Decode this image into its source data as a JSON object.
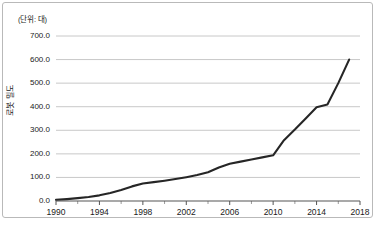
{
  "figure": {
    "unit_note": "(단위: 대)",
    "y_axis_title": "로봇 밀도",
    "frame_color": "#b9b9b9",
    "grid_color": "#c8c8c8",
    "axis_color": "#555555",
    "series_color": "#262626"
  },
  "chart_data": {
    "type": "line",
    "title": "",
    "subtitle": "",
    "xlabel": "",
    "ylabel": "로봇 밀도",
    "unit": "(단위: 대)",
    "xlim": [
      1990,
      2018
    ],
    "ylim": [
      0,
      700
    ],
    "grid": true,
    "legend": "none",
    "y_ticks": [
      "0.0",
      "100.0",
      "200.0",
      "300.0",
      "400.0",
      "500.0",
      "600.0",
      "700.0"
    ],
    "y_tick_values": [
      0,
      100,
      200,
      300,
      400,
      500,
      600,
      700
    ],
    "x_ticks": [
      "1990",
      "1994",
      "1998",
      "2002",
      "2006",
      "2010",
      "2014",
      "2018"
    ],
    "x_tick_values": [
      1990,
      1994,
      1998,
      2002,
      2006,
      2010,
      2014,
      2018
    ],
    "series": [
      {
        "name": "로봇 밀도",
        "color": "#262626",
        "x": [
          1990,
          1991,
          1992,
          1993,
          1994,
          1995,
          1996,
          1997,
          1998,
          1999,
          2000,
          2001,
          2002,
          2003,
          2004,
          2005,
          2006,
          2007,
          2008,
          2009,
          2010,
          2011,
          2012,
          2013,
          2014,
          2015,
          2016,
          2017
        ],
        "values": [
          5,
          8,
          12,
          17,
          24,
          34,
          47,
          62,
          74,
          80,
          86,
          93,
          101,
          110,
          122,
          142,
          158,
          167,
          176,
          185,
          194,
          258,
          303,
          350,
          398,
          409,
          500,
          600
        ]
      }
    ]
  }
}
